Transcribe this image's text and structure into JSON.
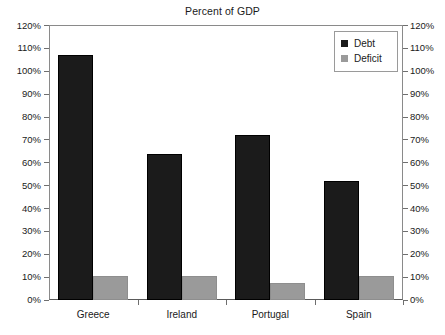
{
  "chart_data": {
    "type": "bar",
    "title": "Percent of GDP",
    "xlabel": "",
    "ylabel": "",
    "categories": [
      "Greece",
      "Ireland",
      "Portugal",
      "Spain"
    ],
    "series": [
      {
        "name": "Debt",
        "values": [
          107,
          64,
          72,
          52
        ],
        "color": "#1b1b1b"
      },
      {
        "name": "Deficit",
        "values": [
          10.5,
          10.5,
          7.5,
          10.5
        ],
        "color": "#9a9a9a"
      }
    ],
    "ylim": [
      0,
      120
    ],
    "ytick_step": 10,
    "ytick_labels": [
      "120%",
      "110%",
      "100%",
      "90%",
      "80%",
      "70%",
      "60%",
      "50%",
      "40%",
      "30%",
      "20%",
      "10%",
      "0%"
    ],
    "ytick_values": [
      120,
      110,
      100,
      90,
      80,
      70,
      60,
      50,
      40,
      30,
      20,
      10,
      0
    ],
    "dual_axis": true,
    "right_axis_labels": [
      "120%",
      "110%",
      "100%",
      "90%",
      "80%",
      "70%",
      "60%",
      "50%",
      "40%",
      "30%",
      "20%",
      "10%",
      "0%"
    ],
    "grid": false,
    "legend": {
      "position": "top-right",
      "entries": [
        {
          "label": "Debt",
          "color": "#1b1b1b",
          "marker": "square"
        },
        {
          "label": "Deficit",
          "color": "#9a9a9a",
          "marker": "square"
        }
      ]
    }
  }
}
